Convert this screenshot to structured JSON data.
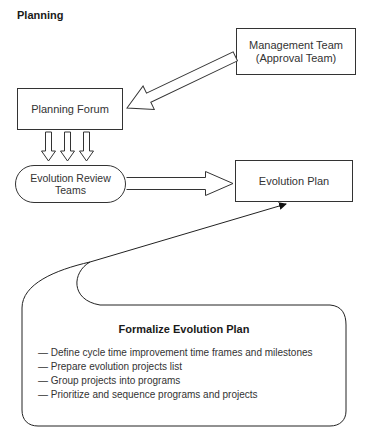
{
  "title": "Planning",
  "nodes": {
    "management": {
      "line1": "Management Team",
      "line2": "(Approval Team)"
    },
    "planning_forum": {
      "label": "Planning Forum"
    },
    "review_teams": {
      "line1": "Evolution Review",
      "line2": "Teams"
    },
    "evolution_plan": {
      "label": "Evolution Plan"
    }
  },
  "callout": {
    "title": "Formalize Evolution Plan",
    "bullet": "—",
    "items": [
      "Define cycle time improvement time frames and milestones",
      "Prepare evolution projects list",
      "Group projects into programs",
      "Prioritize and sequence programs and projects"
    ]
  },
  "edges": [
    {
      "from": "management",
      "to": "planning_forum",
      "style": "hollow-arrow"
    },
    {
      "from": "planning_forum",
      "to": "review_teams",
      "style": "triple-hollow-arrow"
    },
    {
      "from": "review_teams",
      "to": "evolution_plan",
      "style": "hollow-arrow"
    },
    {
      "from": "callout",
      "to": "evolution_plan",
      "style": "line-arrow"
    }
  ]
}
